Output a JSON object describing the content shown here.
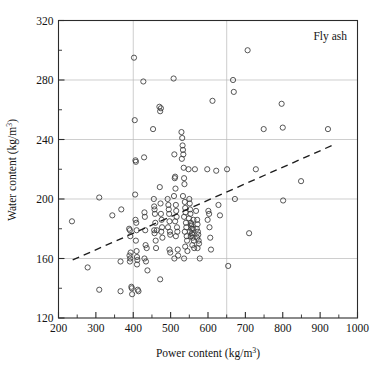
{
  "chart_data": {
    "type": "scatter",
    "title": "",
    "annotation": "Fly ash",
    "xlabel_parts": {
      "main": "Power content (kg/m",
      "sup": "3",
      "tail": ")"
    },
    "ylabel_parts": {
      "main": "Water content (kg/m",
      "sup": "3",
      "tail": ")"
    },
    "xlabel": "Power content (kg/m3)",
    "ylabel": "Water content (kg/m3)",
    "xlim": [
      200,
      1000
    ],
    "ylim": [
      120,
      320
    ],
    "x_major_ticks": [
      200,
      300,
      400,
      500,
      600,
      700,
      800,
      900,
      1000
    ],
    "x_minor_ticks": [
      250,
      350,
      450,
      550,
      650,
      750,
      850,
      950
    ],
    "y_major_ticks": [
      120,
      160,
      200,
      240,
      280,
      320
    ],
    "y_minor_ticks": [
      140,
      180,
      220,
      260,
      300
    ],
    "x_tick_labels": [
      "200",
      "300",
      "400",
      "500",
      "600",
      "700",
      "800",
      "900",
      "1000"
    ],
    "y_tick_labels": [
      "120",
      "160",
      "200",
      "240",
      "280",
      "320"
    ],
    "grid": {
      "enabled": true,
      "x_gridlines": [
        400,
        650
      ],
      "y_gridlines": [
        160,
        200,
        240,
        280
      ]
    },
    "legend": {
      "position": "none"
    },
    "marker": {
      "shape": "circle-open",
      "radius_px": 2.6,
      "color": "#3a3a3a"
    },
    "trendline": {
      "style": "dashed",
      "color": "#1c1c1c",
      "x_start": 238,
      "y_start": 159,
      "x_end": 932,
      "y_end": 236
    },
    "series": [
      {
        "name": "Fly ash mixes",
        "points": [
          [
            236,
            185
          ],
          [
            278,
            154
          ],
          [
            309,
            201
          ],
          [
            309,
            139
          ],
          [
            344,
            189
          ],
          [
            368,
            193
          ],
          [
            366,
            158
          ],
          [
            366,
            138
          ],
          [
            389,
            180
          ],
          [
            391,
            179
          ],
          [
            392,
            175
          ],
          [
            390,
            162
          ],
          [
            392,
            160
          ],
          [
            391,
            158
          ],
          [
            393,
            164
          ],
          [
            395,
            141
          ],
          [
            396,
            140
          ],
          [
            397,
            136
          ],
          [
            402,
            295
          ],
          [
            404,
            253
          ],
          [
            405,
            203
          ],
          [
            406,
            226
          ],
          [
            407,
            225
          ],
          [
            406,
            186
          ],
          [
            408,
            184
          ],
          [
            409,
            179
          ],
          [
            407,
            172
          ],
          [
            409,
            165
          ],
          [
            410,
            161
          ],
          [
            411,
            159
          ],
          [
            410,
            156
          ],
          [
            412,
            139
          ],
          [
            414,
            138
          ],
          [
            427,
            279
          ],
          [
            429,
            228
          ],
          [
            430,
            191
          ],
          [
            431,
            188
          ],
          [
            432,
            179
          ],
          [
            433,
            169
          ],
          [
            430,
            160
          ],
          [
            434,
            158
          ],
          [
            436,
            167
          ],
          [
            438,
            152
          ],
          [
            453,
            247
          ],
          [
            455,
            200
          ],
          [
            456,
            195
          ],
          [
            457,
            193
          ],
          [
            458,
            190
          ],
          [
            459,
            184
          ],
          [
            456,
            179
          ],
          [
            457,
            177
          ],
          [
            460,
            172
          ],
          [
            461,
            167
          ],
          [
            463,
            179
          ],
          [
            470,
            262
          ],
          [
            472,
            259
          ],
          [
            474,
            261
          ],
          [
            471,
            208
          ],
          [
            473,
            197
          ],
          [
            474,
            190
          ],
          [
            476,
            186
          ],
          [
            477,
            181
          ],
          [
            475,
            178
          ],
          [
            478,
            174
          ],
          [
            472,
            146
          ],
          [
            492,
            200
          ],
          [
            494,
            196
          ],
          [
            495,
            193
          ],
          [
            496,
            190
          ],
          [
            497,
            185
          ],
          [
            493,
            181
          ],
          [
            498,
            178
          ],
          [
            499,
            176
          ],
          [
            497,
            166
          ],
          [
            499,
            164
          ],
          [
            508,
            281
          ],
          [
            510,
            230
          ],
          [
            511,
            214
          ],
          [
            512,
            215
          ],
          [
            513,
            207
          ],
          [
            509,
            202
          ],
          [
            514,
            196
          ],
          [
            515,
            192
          ],
          [
            516,
            188
          ],
          [
            512,
            185
          ],
          [
            517,
            181
          ],
          [
            518,
            178
          ],
          [
            514,
            175
          ],
          [
            519,
            166
          ],
          [
            520,
            162
          ],
          [
            510,
            160
          ],
          [
            529,
            245
          ],
          [
            531,
            241
          ],
          [
            532,
            236
          ],
          [
            533,
            233
          ],
          [
            534,
            230
          ],
          [
            530,
            227
          ],
          [
            535,
            221
          ],
          [
            536,
            214
          ],
          [
            537,
            210
          ],
          [
            533,
            202
          ],
          [
            538,
            198
          ],
          [
            539,
            194
          ],
          [
            540,
            191
          ],
          [
            536,
            188
          ],
          [
            541,
            184
          ],
          [
            542,
            181
          ],
          [
            538,
            178
          ],
          [
            543,
            175
          ],
          [
            544,
            172
          ],
          [
            539,
            168
          ],
          [
            545,
            165
          ],
          [
            536,
            160
          ],
          [
            548,
            220
          ],
          [
            550,
            200
          ],
          [
            551,
            197
          ],
          [
            552,
            193
          ],
          [
            553,
            190
          ],
          [
            549,
            187
          ],
          [
            554,
            184
          ],
          [
            555,
            182
          ],
          [
            556,
            180
          ],
          [
            552,
            178
          ],
          [
            557,
            177
          ],
          [
            558,
            176
          ],
          [
            554,
            175
          ],
          [
            559,
            174
          ],
          [
            560,
            180
          ],
          [
            556,
            183
          ],
          [
            561,
            186
          ],
          [
            562,
            172
          ],
          [
            558,
            169
          ],
          [
            563,
            167
          ],
          [
            565,
            220
          ],
          [
            568,
            192
          ],
          [
            571,
            186
          ],
          [
            572,
            183
          ],
          [
            570,
            180
          ],
          [
            573,
            178
          ],
          [
            574,
            176
          ],
          [
            571,
            174
          ],
          [
            575,
            172
          ],
          [
            576,
            170
          ],
          [
            572,
            167
          ],
          [
            578,
            160
          ],
          [
            598,
            220
          ],
          [
            601,
            192
          ],
          [
            603,
            190
          ],
          [
            599,
            186
          ],
          [
            604,
            181
          ],
          [
            606,
            174
          ],
          [
            608,
            166
          ],
          [
            612,
            266
          ],
          [
            622,
            219
          ],
          [
            628,
            196
          ],
          [
            632,
            189
          ],
          [
            651,
            220
          ],
          [
            654,
            155
          ],
          [
            667,
            280
          ],
          [
            669,
            272
          ],
          [
            672,
            200
          ],
          [
            706,
            300
          ],
          [
            710,
            177
          ],
          [
            728,
            220
          ],
          [
            749,
            247
          ],
          [
            797,
            264
          ],
          [
            800,
            248
          ],
          [
            801,
            199
          ],
          [
            849,
            212
          ],
          [
            921,
            247
          ]
        ]
      }
    ]
  }
}
